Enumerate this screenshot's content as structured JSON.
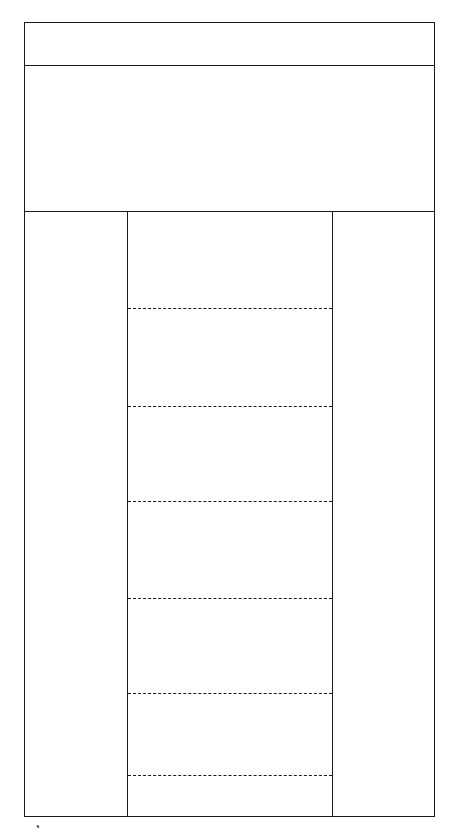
{
  "diagram": {
    "type": "wireframe-layout",
    "line_color": "#1a1a1a",
    "background": "#ffffff",
    "regions": [
      {
        "name": "header",
        "label": ""
      },
      {
        "name": "hero-banner",
        "label": ""
      },
      {
        "name": "left-sidebar",
        "label": ""
      },
      {
        "name": "main-content",
        "label": "",
        "sections": 7
      },
      {
        "name": "right-sidebar",
        "label": ""
      }
    ],
    "main_content_dividers": 6
  }
}
